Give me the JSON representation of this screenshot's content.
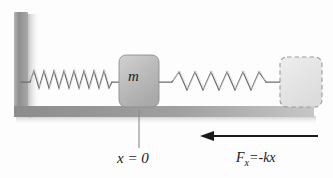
{
  "figure": {
    "background_color": "#fdfdfd"
  },
  "wall": {
    "name": "fixed-wall",
    "color": "#9a9a9a",
    "shadow_color": "#c9c9c9"
  },
  "floor": {
    "name": "floor-surface",
    "color": "#9e9e9e",
    "shadow_color": "#cfcfcf"
  },
  "mass_block": {
    "label": "m",
    "fill_color": "#bdbdbd",
    "border_color": "#8f8f8f"
  },
  "ghost_block": {
    "label": "",
    "fill_color": "#e6e6e6",
    "border_color": "#9b9b9b",
    "border_style": "dashed"
  },
  "springs": {
    "left": {
      "name": "compressed-spring",
      "coils": 10,
      "color": "#6e6e6e",
      "state": "relaxed"
    },
    "right": {
      "name": "stretched-spring",
      "coils": 6,
      "color": "#6e6e6e",
      "state": "stretched"
    }
  },
  "reference_line": {
    "name": "equilibrium-reference-line",
    "color": "#8a8a8a"
  },
  "labels": {
    "origin": "x = 0",
    "force_symbol": "F",
    "force_subscript": "x",
    "force_expression": "=-kx",
    "force_full": "Fx=-kx"
  },
  "force_arrow": {
    "name": "restoring-force-arrow",
    "direction": "left",
    "color": "#1a1a1a"
  }
}
